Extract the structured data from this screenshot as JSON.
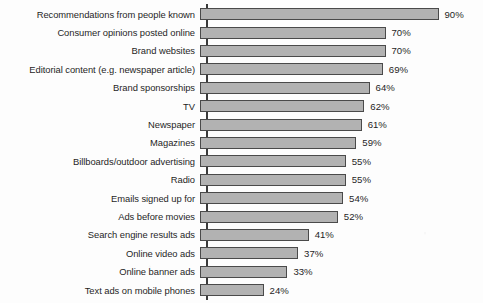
{
  "chart_data": {
    "type": "bar",
    "orientation": "horizontal",
    "title": "",
    "subtitle": "",
    "xlabel": "",
    "ylabel": "",
    "xlim": [
      0,
      100
    ],
    "grid": false,
    "legend": null,
    "value_suffix": "%",
    "categories": [
      "Recommendations from people known",
      "Consumer opinions posted online",
      "Brand websites",
      "Editorial content (e.g. newspaper article)",
      "Brand sponsorships",
      "TV",
      "Newspaper",
      "Magazines",
      "Billboards/outdoor advertising",
      "Radio",
      "Emails signed up for",
      "Ads before movies",
      "Search engine results ads",
      "Online video ads",
      "Online banner ads",
      "Text ads on mobile phones"
    ],
    "values": [
      90,
      70,
      70,
      69,
      64,
      62,
      61,
      59,
      55,
      55,
      54,
      52,
      41,
      37,
      33,
      24
    ],
    "value_labels": [
      "90%",
      "70%",
      "70%",
      "69%",
      "64%",
      "62%",
      "61%",
      "59%",
      "55%",
      "55%",
      "54%",
      "52%",
      "41%",
      "37%",
      "33%",
      "24%"
    ],
    "colors": {
      "bar_fill": "#b2b2b2",
      "bar_stroke": "#4a4a4a",
      "axis": "#3a3a3a",
      "text": "#1f1f1f",
      "background": "#fdfdfd"
    }
  }
}
